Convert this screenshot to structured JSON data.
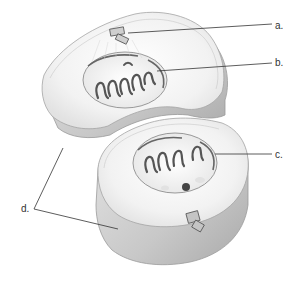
{
  "diagram": {
    "labels": [
      {
        "id": "a",
        "text": "a.",
        "x": 275,
        "y": 21,
        "points_to": "centriole pair (upper cell)"
      },
      {
        "id": "b",
        "text": "b.",
        "x": 275,
        "y": 58,
        "points_to": "reforming nucleus / chromosomes (upper)"
      },
      {
        "id": "c",
        "text": "c.",
        "x": 275,
        "y": 150,
        "points_to": "nuclear envelope (lower nucleus)"
      },
      {
        "id": "d",
        "text": "d.",
        "x": 21,
        "y": 204,
        "points_to": "cleavage furrow / cell membrane of daughter cells"
      }
    ],
    "colors": {
      "cell_fill": "#f4f4f4",
      "cell_side": "#cfcfcf",
      "outline": "#9a9a9a",
      "chromosome": "#555555",
      "leader_line": "#333333"
    }
  }
}
